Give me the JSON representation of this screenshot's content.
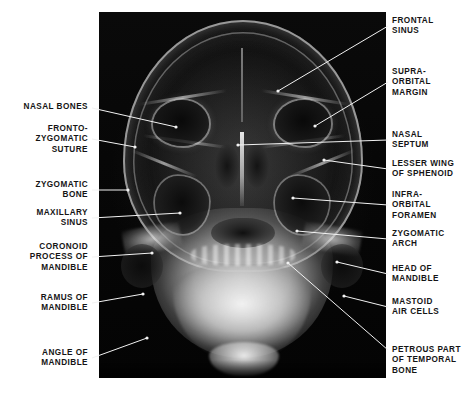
{
  "figure": {
    "kind": "annotated-radiograph",
    "view": "occipitomental (Water's) projection of the skull",
    "image_background": "#050505",
    "page_background": "#ffffff",
    "label_color": "#151515",
    "leader_color": "#f2f2f2",
    "plate": {
      "left": 99,
      "top": 12,
      "width": 287,
      "height": 366
    }
  },
  "labels_left": [
    {
      "id": "nasal-bones",
      "text": "NASAL BONES",
      "x": 88,
      "y": 102,
      "lines": 1,
      "leader": {
        "x1": 92,
        "y1": 108,
        "x2": 176,
        "y2": 127
      }
    },
    {
      "id": "fronto-zygomatic-suture",
      "text": "FRONTO-\nZYGOMATIC\nSUTURE",
      "x": 88,
      "y": 124,
      "lines": 3,
      "leader": {
        "x1": 92,
        "y1": 139,
        "x2": 135,
        "y2": 147
      }
    },
    {
      "id": "zygomatic-bone",
      "text": "ZYGOMATIC\nBONE",
      "x": 88,
      "y": 180,
      "lines": 2,
      "leader": {
        "x1": 92,
        "y1": 190,
        "x2": 128,
        "y2": 190
      }
    },
    {
      "id": "maxillary-sinus",
      "text": "MAXILLARY\nSINUS",
      "x": 88,
      "y": 208,
      "lines": 2,
      "leader": {
        "x1": 92,
        "y1": 218,
        "x2": 180,
        "y2": 213
      }
    },
    {
      "id": "coronoid-process-of-mandible",
      "text": "CORONOID\nPROCESS OF\nMANDIBLE",
      "x": 88,
      "y": 242,
      "lines": 3,
      "leader": {
        "x1": 92,
        "y1": 257,
        "x2": 152,
        "y2": 253
      }
    },
    {
      "id": "ramus-of-mandible",
      "text": "RAMUS OF\nMANDIBLE",
      "x": 88,
      "y": 293,
      "lines": 2,
      "leader": {
        "x1": 92,
        "y1": 303,
        "x2": 143,
        "y2": 294
      }
    },
    {
      "id": "angle-of-mandible",
      "text": "ANGLE OF\nMANDIBLE",
      "x": 88,
      "y": 348,
      "lines": 2,
      "leader": {
        "x1": 92,
        "y1": 358,
        "x2": 147,
        "y2": 338
      }
    }
  ],
  "labels_right": [
    {
      "id": "frontal-sinus",
      "text": "FRONTAL\nSINUS",
      "x": 392,
      "y": 16,
      "lines": 2,
      "leader": {
        "x1": 388,
        "y1": 26,
        "x2": 278,
        "y2": 91
      }
    },
    {
      "id": "supra-orbital-margin",
      "text": "SUPRA-\nORBITAL\nMARGIN",
      "x": 392,
      "y": 67,
      "lines": 3,
      "leader": {
        "x1": 388,
        "y1": 82,
        "x2": 315,
        "y2": 126
      }
    },
    {
      "id": "nasal-septum",
      "text": "NASAL\nSEPTUM",
      "x": 392,
      "y": 130,
      "lines": 2,
      "leader": {
        "x1": 388,
        "y1": 140,
        "x2": 238,
        "y2": 145
      }
    },
    {
      "id": "lesser-wing-of-sphenoid",
      "text": "LESSER WING\nOF SPHENOID",
      "x": 392,
      "y": 159,
      "lines": 2,
      "leader": {
        "x1": 388,
        "y1": 169,
        "x2": 324,
        "y2": 160
      }
    },
    {
      "id": "infra-orbital-foramen",
      "text": "INFRA-\nORBITAL\nFORAMEN",
      "x": 392,
      "y": 190,
      "lines": 3,
      "leader": {
        "x1": 388,
        "y1": 205,
        "x2": 293,
        "y2": 198
      }
    },
    {
      "id": "zygomatic-arch",
      "text": "ZYGOMATIC\nARCH",
      "x": 392,
      "y": 229,
      "lines": 2,
      "leader": {
        "x1": 388,
        "y1": 239,
        "x2": 297,
        "y2": 231
      }
    },
    {
      "id": "head-of-mandible",
      "text": "HEAD OF\nMANDIBLE",
      "x": 392,
      "y": 264,
      "lines": 2,
      "leader": {
        "x1": 388,
        "y1": 274,
        "x2": 337,
        "y2": 262
      }
    },
    {
      "id": "mastoid-air-cells",
      "text": "MASTOID\nAIR CELLS",
      "x": 392,
      "y": 297,
      "lines": 2,
      "leader": {
        "x1": 388,
        "y1": 307,
        "x2": 344,
        "y2": 296
      }
    },
    {
      "id": "petrous-part-of-temporal-bone",
      "text": "PETROUS PART\nOF TEMPORAL\nBONE",
      "x": 392,
      "y": 345,
      "lines": 3,
      "leader": {
        "x1": 388,
        "y1": 350,
        "x2": 288,
        "y2": 263
      }
    }
  ]
}
